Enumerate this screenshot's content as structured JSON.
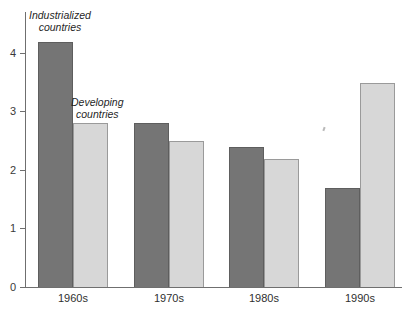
{
  "chart_data": {
    "type": "bar",
    "title": "",
    "xlabel": "",
    "ylabel": "",
    "categories": [
      "1960s",
      "1970s",
      "1980s",
      "1990s"
    ],
    "series": [
      {
        "name": "Industrialized countries",
        "color": "#757575",
        "values": [
          4.2,
          2.8,
          2.4,
          1.7
        ]
      },
      {
        "name": "Developing countries",
        "color": "#d7d7d7",
        "values": [
          2.8,
          2.5,
          2.2,
          3.5
        ]
      }
    ],
    "ylim": [
      0,
      4.7
    ],
    "yticks": [
      0,
      1,
      2,
      3,
      4
    ],
    "ytick_labels": [
      "0",
      "1",
      "2",
      "3",
      "4"
    ],
    "grid": false,
    "legend_position": "in-plot-annotations",
    "annotations": [
      {
        "id": "industrialized",
        "line1": "Industrialized",
        "line2": "countries"
      },
      {
        "id": "developing",
        "line1": "Developing",
        "line2": "countries"
      }
    ],
    "colors": {
      "industrialized": "#757575",
      "developing": "#d7d7d7",
      "axis": "#6f6f6f",
      "background": "#ffffff",
      "text": "#2f2f2f"
    }
  }
}
